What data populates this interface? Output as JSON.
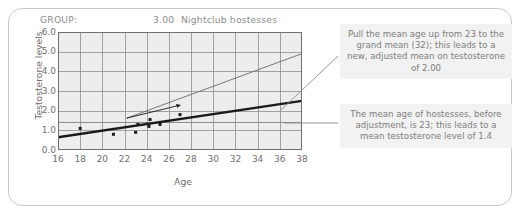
{
  "chart_header": {
    "group_label": "GROUP:",
    "group_code": "3.00",
    "group_name": "Nightclub hostesses"
  },
  "annotations": {
    "callout_1": "Pull the mean age up from 23 to the grand mean (32); this leads to a new, adjusted mean on testosterone of 2.00",
    "callout_2": "The mean age of hostesses, before adjustment, is 23; this leads to a mean testosterone level of 1.4"
  },
  "chart_data": {
    "type": "scatter",
    "title": "Nightclub hostesses",
    "xlabel": "Age",
    "ylabel": "Testosterone levels",
    "xlim": [
      16,
      38
    ],
    "ylim": [
      0.0,
      6.0
    ],
    "xticks": [
      16,
      18,
      20,
      22,
      24,
      26,
      28,
      30,
      32,
      34,
      36,
      38
    ],
    "yticks": [
      "0.0",
      "1.0",
      "2.0",
      "3.0",
      "4.0",
      "5.0",
      "6.0"
    ],
    "grid": true,
    "legend": "none",
    "points": [
      {
        "x": 18.0,
        "y": 1.1
      },
      {
        "x": 21.0,
        "y": 0.8
      },
      {
        "x": 23.0,
        "y": 0.9
      },
      {
        "x": 23.2,
        "y": 1.3
      },
      {
        "x": 24.2,
        "y": 1.2
      },
      {
        "x": 24.3,
        "y": 1.55
      },
      {
        "x": 25.2,
        "y": 1.3
      },
      {
        "x": 27.0,
        "y": 1.8
      }
    ],
    "series": [
      {
        "name": "within-group regression line",
        "type": "line",
        "style": "thick",
        "points": [
          {
            "x": 16,
            "y": 0.65
          },
          {
            "x": 38,
            "y": 2.5
          }
        ]
      },
      {
        "name": "adjustment leader line",
        "type": "line",
        "style": "thin",
        "points": [
          {
            "x": 22.2,
            "y": 1.62
          },
          {
            "x": 38,
            "y": 4.9
          }
        ]
      },
      {
        "name": "adjustment arrow",
        "type": "arrow",
        "style": "thin",
        "points": [
          {
            "x": 22.2,
            "y": 1.62
          },
          {
            "x": 27.0,
            "y": 2.28
          }
        ]
      },
      {
        "name": "mean testosterone reference",
        "type": "hline",
        "style": "thin-gray",
        "y": 1.4
      }
    ],
    "markers": {
      "mean_age_before": 23,
      "grand_mean_age": 32,
      "mean_testosterone_before": 1.4,
      "adjusted_mean_testosterone": 2.0
    },
    "colors": {
      "plot_background": "#ededed",
      "grid": "#8d8d8d",
      "axis": "#6f6f6f",
      "regression_line": "#1a1a1a",
      "point": "#1a1a1a",
      "callout_background": "#f2f2f2",
      "callout_text": "#7d7d7d",
      "frame_border": "#c9c9c9"
    }
  }
}
